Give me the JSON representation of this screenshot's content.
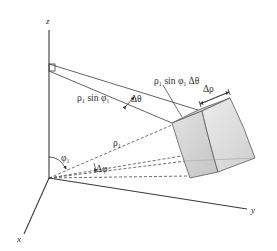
{
  "figure": {
    "axes": {
      "z": "z",
      "x": "x",
      "y": "y"
    },
    "labels": {
      "rho_sin_phi": "ρ₁ sin φ₁",
      "delta_theta": "Δθ",
      "rho_sin_phi_dtheta": "ρ₁ sin φ₁ Δθ",
      "delta_rho": "Δρ",
      "rho": "ρ₁",
      "phi": "φ₁",
      "delta_phi": "Δφ"
    },
    "colors": {
      "line": "#3a3a3a",
      "cube_fill": "#d4d4d4",
      "cube_light": "#e6e6e6",
      "cube_dark": "#bdbdbd",
      "text": "#2a2a2a"
    }
  }
}
